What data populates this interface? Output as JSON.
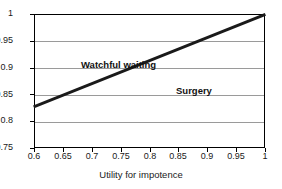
{
  "chart_data": {
    "type": "line",
    "title": "",
    "subtitle": "",
    "xlabel": "Utility for impotence",
    "ylabel": "",
    "xlim": [
      0.6,
      1
    ],
    "ylim": [
      0.75,
      1
    ],
    "grid": "horizontal",
    "legend": "none",
    "xticks": [
      "0.6",
      "0.65",
      "0.7",
      "0.75",
      "0.8",
      "0.85",
      "0.9",
      "0.95",
      "1"
    ],
    "xtick_values": [
      0.6,
      0.65,
      0.7,
      0.75,
      0.8,
      0.85,
      0.9,
      0.95,
      1
    ],
    "yticks": [
      "1",
      "0.95",
      "0.9",
      "0.85",
      "0.8",
      "0.75"
    ],
    "ytick_values": [
      1,
      0.95,
      0.9,
      0.85,
      0.8,
      0.75
    ],
    "series": [
      {
        "name": "threshold-line",
        "color": "#1a1a1a",
        "x": [
          0.6,
          1.0
        ],
        "values": [
          0.827,
          1.0
        ]
      }
    ],
    "annotations": [
      {
        "text": "Watchful waiting",
        "x": 0.68,
        "y": 0.935,
        "region": "above-line"
      },
      {
        "text": "Surgery",
        "x": 0.845,
        "y": 0.888,
        "region": "below-line"
      }
    ]
  },
  "axes": {
    "x_title": "Utility for impotence",
    "x_labels": [
      "0.6",
      "0.65",
      "0.7",
      "0.75",
      "0.8",
      "0.85",
      "0.9",
      "0.95",
      "1"
    ],
    "y_labels": [
      "1",
      "0.95",
      "0.9",
      "0.85",
      "0.8",
      "0.75"
    ]
  },
  "labels": {
    "watchful_waiting": "Watchful waiting",
    "surgery": "Surgery"
  },
  "colors": {
    "line": "#1a1a1a",
    "grid": "#9a9a9a",
    "frame": "#000000",
    "background": "#ffffff",
    "text": "#1a1a1a"
  }
}
